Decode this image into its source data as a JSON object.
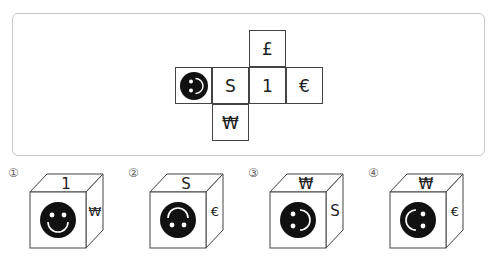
{
  "net": {
    "cells": [
      {
        "id": "top",
        "symbol": "£",
        "type": "text",
        "col": 2,
        "row": 0
      },
      {
        "id": "smiley",
        "symbol": "smiley-face",
        "type": "icon",
        "col": 0,
        "row": 1,
        "rotation": -90
      },
      {
        "id": "s",
        "symbol": "S",
        "type": "text",
        "col": 1,
        "row": 1
      },
      {
        "id": "one",
        "symbol": "1",
        "type": "text",
        "col": 2,
        "row": 1
      },
      {
        "id": "euro",
        "symbol": "€",
        "type": "text",
        "col": 3,
        "row": 1
      },
      {
        "id": "won",
        "symbol": "₩",
        "type": "text",
        "col": 1,
        "row": 2
      }
    ]
  },
  "options": [
    {
      "number": "①",
      "top": "1",
      "front": "smiley-face",
      "front_rotation": 0,
      "right": "₩"
    },
    {
      "number": "②",
      "top": "S",
      "front": "smiley-face",
      "front_rotation": 180,
      "right": "€"
    },
    {
      "number": "③",
      "top": "₩",
      "front": "smiley-face",
      "front_rotation": -90,
      "right": "S"
    },
    {
      "number": "④",
      "top": "₩",
      "front": "smiley-face",
      "front_rotation": 90,
      "right": "€"
    }
  ],
  "colors": {
    "line": "#444444",
    "panel_border": "#c8c8c8",
    "face_fill": "#111111"
  }
}
